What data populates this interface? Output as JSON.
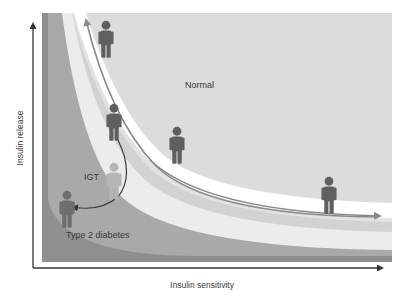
{
  "figure": {
    "axes": {
      "x_label": "Insulin sensitivity",
      "y_label": "Insulin release"
    },
    "regions": [
      {
        "id": "normal",
        "label": "Normal",
        "color": "#dcdcdc"
      },
      {
        "id": "igt",
        "label": "IGT",
        "color": "#ececec"
      },
      {
        "id": "type2",
        "label": "Type 2 diabetes",
        "color": "#a9a9a9"
      }
    ],
    "bands": {
      "outer_strip": "#8f8f8f",
      "type2_region": "#a9a9a9",
      "very_light_band": "#ececec",
      "light_band": "#d2d2d2",
      "white_band": "#ffffff",
      "normal_region": "#dcdcdc"
    },
    "figures": [
      {
        "id": "person-normal-top",
        "color": "#5f5f5f"
      },
      {
        "id": "person-normal-mid-left",
        "color": "#5f5f5f"
      },
      {
        "id": "person-normal-mid",
        "color": "#5f5f5f"
      },
      {
        "id": "person-normal-right",
        "color": "#5f5f5f"
      },
      {
        "id": "person-igt",
        "color": "#b5b5b5"
      },
      {
        "id": "person-type2",
        "color": "#6e6e6e"
      }
    ],
    "arrows": {
      "hyperbola_arrow_color": "#6a6a6a",
      "progression_arrow_color": "#3a3a3a",
      "axis_color": "#333333"
    }
  }
}
